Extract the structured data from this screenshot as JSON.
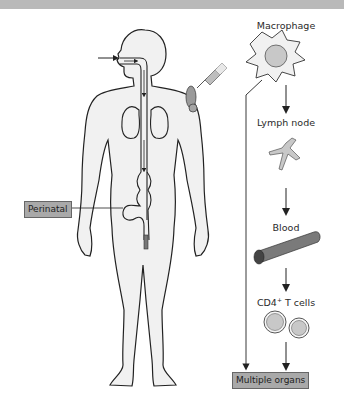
{
  "figure": {
    "topband_color": "#b9b9b9",
    "body_fill": "#f1f1f1",
    "cell_fill": "#c8c8c8",
    "box_fill": "#a9a9a9"
  },
  "labels": {
    "macrophage": "Macrophage",
    "lymph_node": "Lymph node",
    "blood": "Blood",
    "cd4_prefix": "CD4",
    "cd4_sup": "+",
    "cd4_suffix": " T cells",
    "perinatal": "Perinatal",
    "multiple_organs": "Multiple organs"
  },
  "routes": [
    {
      "name": "inhalation",
      "icon": "arrow-into-mouth"
    },
    {
      "name": "injection",
      "icon": "syringe"
    },
    {
      "name": "ingestion",
      "icon": "gut-tract"
    },
    {
      "name": "perinatal",
      "icon": "arrow-to-label"
    }
  ],
  "pathway": [
    "Macrophage",
    "Lymph node",
    "Blood",
    "CD4+ T cells",
    "Multiple organs"
  ]
}
